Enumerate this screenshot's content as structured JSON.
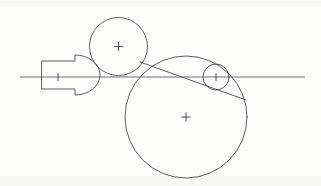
{
  "document": {
    "type": "engineering-line-drawing",
    "title": "Tangent circles with arrow-and-dome profile",
    "background_color": "#fdfdfb",
    "line_color": "#4a4a52",
    "axis_color": "#54545c",
    "canvas": {
      "width": 321,
      "height": 186
    }
  },
  "chart_data": {
    "type": "diagram",
    "xlabel": "",
    "ylabel": "",
    "xlim": [
      0,
      321
    ],
    "ylim": [
      0,
      186
    ],
    "grid": false,
    "legend": "none",
    "axis": {
      "name": "horizontal-centerline",
      "y": 77,
      "x_start": 20,
      "x_end": 305
    },
    "circles": [
      {
        "name": "upper-circle",
        "cx": 118.5,
        "cy": 46.5,
        "r": 29,
        "center_mark": "cross",
        "center_mark_size": 4.5
      },
      {
        "name": "large-circle",
        "cx": 186,
        "cy": 117,
        "r": 61,
        "center_mark": "cross",
        "center_mark_size": 4.5
      },
      {
        "name": "small-right-circle",
        "cx": 216,
        "cy": 77,
        "r": 13,
        "center_mark": "tick",
        "center_mark_size": 4
      }
    ],
    "polyline_shape": {
      "name": "arrow-dome-profile",
      "rect_left": 42,
      "rect_top": 61,
      "rect_bottom": 89,
      "step_x": 75,
      "flange_top": 55,
      "flange_bottom": 95,
      "dome_radius": 20,
      "dome_apex_x": 100,
      "points": [
        [
          42,
          61
        ],
        [
          75,
          61
        ],
        [
          75,
          55
        ],
        [
          95,
          60
        ],
        [
          100,
          75
        ],
        [
          95,
          91
        ],
        [
          75,
          95
        ],
        [
          75,
          89
        ],
        [
          42,
          89
        ],
        [
          42,
          61
        ]
      ]
    },
    "tangent_line": {
      "name": "tangent-chord",
      "x1": 140,
      "y1": 62,
      "x2": 246,
      "y2": 100
    },
    "center_tick_left": {
      "name": "axis-center-tick",
      "x": 58,
      "y": 77,
      "size": 4
    }
  }
}
